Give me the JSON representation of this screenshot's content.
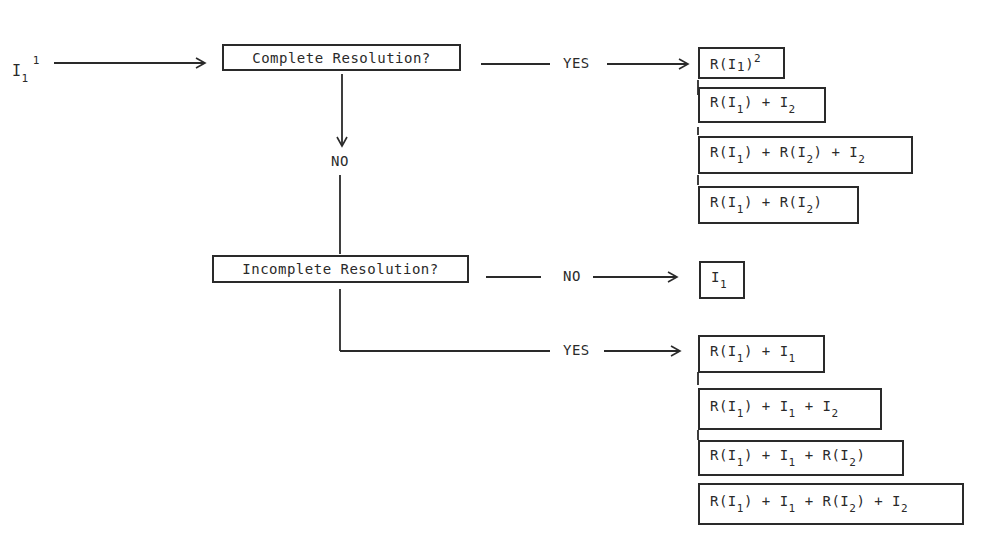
{
  "input": {
    "base": "I",
    "sub": "1",
    "sup": "1"
  },
  "decisions": {
    "complete": {
      "label": "Complete Resolution?"
    },
    "incomplete": {
      "label": "Incomplete Resolution?"
    }
  },
  "branches": {
    "complete_yes": "YES",
    "complete_no": "NO",
    "incomplete_no": "NO",
    "incomplete_yes": "YES"
  },
  "outcomes": {
    "complete_yes": [
      {
        "parts": [
          [
            "R(I",
            ""
          ],
          [
            "1",
            "sub-inline"
          ],
          [
            ")",
            ""
          ],
          [
            "2",
            "sup"
          ]
        ]
      },
      {
        "parts": [
          [
            "R(I",
            ""
          ],
          [
            "1",
            "sub"
          ],
          [
            ") + I",
            ""
          ],
          [
            "2",
            "sub"
          ]
        ]
      },
      {
        "parts": [
          [
            "R(I",
            ""
          ],
          [
            "1",
            "sub"
          ],
          [
            ") + R(I",
            ""
          ],
          [
            "2",
            "sub"
          ],
          [
            ") + I",
            ""
          ],
          [
            "2",
            "sub"
          ]
        ]
      },
      {
        "parts": [
          [
            "R(I",
            ""
          ],
          [
            "1",
            "sub"
          ],
          [
            ") + R(I",
            ""
          ],
          [
            "2",
            "sub"
          ],
          [
            ")",
            ""
          ]
        ]
      }
    ],
    "incomplete_no": [
      {
        "parts": [
          [
            "I",
            ""
          ],
          [
            "1",
            "sub"
          ]
        ]
      }
    ],
    "incomplete_yes": [
      {
        "parts": [
          [
            "R(I",
            ""
          ],
          [
            "1",
            "sub"
          ],
          [
            ") + I",
            ""
          ],
          [
            "1",
            "sub"
          ]
        ]
      },
      {
        "parts": [
          [
            "R(I",
            ""
          ],
          [
            "1",
            "sub"
          ],
          [
            ") + I",
            ""
          ],
          [
            "1",
            "sub"
          ],
          [
            " + I",
            ""
          ],
          [
            "2",
            "sub"
          ]
        ]
      },
      {
        "parts": [
          [
            "R(I",
            ""
          ],
          [
            "1",
            "sub"
          ],
          [
            ") + I",
            ""
          ],
          [
            "1",
            "sub"
          ],
          [
            " + R(I",
            ""
          ],
          [
            "2",
            "sub"
          ],
          [
            ")",
            ""
          ]
        ]
      },
      {
        "parts": [
          [
            "R(I",
            ""
          ],
          [
            "1",
            "sub"
          ],
          [
            ") + I",
            ""
          ],
          [
            "1",
            "sub"
          ],
          [
            " + R(I",
            ""
          ],
          [
            "2",
            "sub"
          ],
          [
            ") + I",
            ""
          ],
          [
            "2",
            "sub"
          ]
        ]
      }
    ]
  }
}
